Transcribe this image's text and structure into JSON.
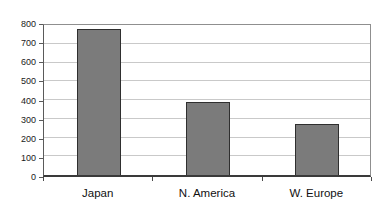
{
  "chart_data": {
    "type": "bar",
    "title": "",
    "xlabel": "",
    "ylabel": "",
    "categories": [
      "Japan",
      "N. America",
      "W. Europe"
    ],
    "values": [
      780,
      390,
      270
    ],
    "ylim": [
      0,
      800
    ],
    "ytick_interval": 100,
    "yticks": [
      0,
      100,
      200,
      300,
      400,
      500,
      600,
      700,
      800
    ],
    "grid": "horizontal",
    "legend": "none",
    "colors": {
      "bar_fill": "#7b7b7b",
      "bar_border": "#2f2f2f",
      "gridline": "#c9c9c9",
      "axis": "#3a3a3a",
      "plot_border": "#8f8f8f",
      "background": "#ffffff",
      "text": "#111111"
    }
  }
}
